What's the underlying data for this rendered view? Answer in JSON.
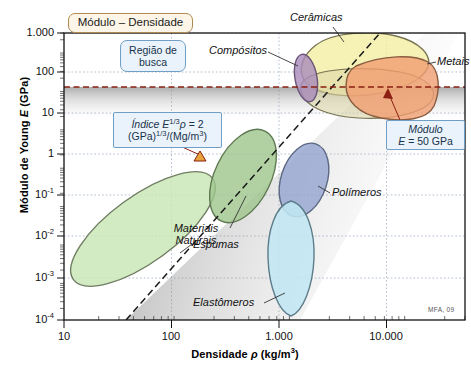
{
  "figure": {
    "kind": "ashby-material-property-chart",
    "signature": "MFA, 09"
  },
  "axes": {
    "y_title_parts": {
      "prefix": "Módulo de Young ",
      "italic": "E",
      "suffix": " (GPa)"
    },
    "x_title_parts": {
      "prefix": "Densidade ",
      "italic": "ρ",
      "suffix": " (kg/m"
    },
    "x_title_exp": "3",
    "x_title_close": ")",
    "y_ticks": [
      {
        "label": "1.000",
        "value": 1000
      },
      {
        "label": "100",
        "value": 100
      },
      {
        "label": "10",
        "value": 10
      },
      {
        "label": "1",
        "value": 1
      },
      {
        "label": "10⁻¹",
        "base": "10",
        "exp": "-1",
        "value": 0.1
      },
      {
        "label": "10⁻²",
        "base": "10",
        "exp": "-2",
        "value": 0.01
      },
      {
        "label": "10⁻³",
        "base": "10",
        "exp": "-3",
        "value": 0.001
      },
      {
        "label": "10⁻⁴",
        "base": "10",
        "exp": "-4",
        "value": 0.0001
      }
    ],
    "x_ticks": [
      {
        "label": "10",
        "value": 10
      },
      {
        "label": "100",
        "value": 100
      },
      {
        "label": "1.000",
        "value": 1000
      },
      {
        "label": "10.000",
        "value": 10000
      }
    ]
  },
  "callouts": [
    {
      "id": "title-box",
      "text": "Módulo – Densidade",
      "style": "cream"
    },
    {
      "id": "search-region",
      "line1": "Região de",
      "line2": "busca",
      "style": "blue"
    },
    {
      "id": "index-box",
      "style": "blue",
      "l1_italic": "Índice ",
      "l1_E": "E",
      "l1_exp": "1/3",
      "l1_rho": "ρ",
      "l1_eq": " = 2",
      "l2_a": "(GPa)",
      "l2_exp": "1/3",
      "l2_b": "/(Mg/m",
      "l2_exp2": "3",
      "l2_c": ")"
    },
    {
      "id": "modulus-box",
      "style": "blue",
      "line1": "Módulo",
      "line2_E": "E",
      "line2_rest": " = 50 GPa"
    }
  ],
  "series_labels": [
    {
      "name": "Cerâmicas",
      "text": "Cerâmicas"
    },
    {
      "name": "Compósitos",
      "text": "Compósitos"
    },
    {
      "name": "Metais",
      "text": "Metais"
    },
    {
      "name": "Polímeros",
      "text": "Polímeros"
    },
    {
      "name": "MateriaisNaturais",
      "text": "Materiais Naturais",
      "l1": "Materiais",
      "l2": "Naturais"
    },
    {
      "name": "Espumas",
      "text": "Espumas"
    },
    {
      "name": "Elastômeros",
      "text": "Elastômeros"
    }
  ],
  "chart_data": {
    "type": "scatter",
    "title": "Módulo – Densidade",
    "xlabel": "Densidade ρ (kg/m3)",
    "ylabel": "Módulo de Young E (GPa)",
    "xscale": "log",
    "yscale": "log",
    "xlim": [
      10,
      30000
    ],
    "ylim": [
      0.0001,
      3000
    ],
    "grid": true,
    "legend": "in-plot annotations",
    "annotations": [
      {
        "text": "Módulo – Densidade",
        "role": "chart-title-box"
      },
      {
        "text": "Região de busca",
        "role": "search-region-label"
      },
      {
        "text": "Índice E^(1/3)ρ = 2 (GPa)^(1/3)/(Mg/m^3)",
        "role": "material-index-label"
      },
      {
        "text": "Módulo E = 50 GPa",
        "role": "constraint-label"
      },
      {
        "text": "MFA, 09",
        "role": "signature"
      }
    ],
    "guide_lines": [
      {
        "name": "modulus-constraint",
        "type": "horizontal",
        "y": 50,
        "label": "E = 50 GPa",
        "style": "dashed",
        "color": "#8a1f12"
      },
      {
        "name": "index-line",
        "type": "slope",
        "slope_exponent": 3,
        "label": "E^(1/3)/ρ = 2 (GPa)^(1/3)/(Mg/m^3)",
        "style": "dashed",
        "color": "#1a1a1a"
      }
    ],
    "shaded_regions": [
      {
        "name": "below-modulus-constraint",
        "description": "grey gradient band below E = 50 GPa"
      },
      {
        "name": "below-index-line",
        "description": "grey gradient wedge below the E^(1/3)/ρ guide line"
      }
    ],
    "bubbles": [
      {
        "name": "Cerâmicas",
        "color": "#f2ea9a",
        "rho_range": [
          1800,
          8000
        ],
        "E_range": [
          20,
          1000
        ]
      },
      {
        "name": "Compósitos",
        "color": "#a58cb6",
        "rho_range": [
          1500,
          2100
        ],
        "E_range": [
          15,
          200
        ]
      },
      {
        "name": "Metais",
        "color": "#ef9a6e",
        "rho_range": [
          2500,
          20000
        ],
        "E_range": [
          8,
          300
        ]
      },
      {
        "name": "Polímeros",
        "color": "#8fa0cc",
        "rho_range": [
          800,
          1600
        ],
        "E_range": [
          0.05,
          8
        ]
      },
      {
        "name": "Materiais Naturais",
        "color": "#9dc08b",
        "rho_range": [
          200,
          1100
        ],
        "E_range": [
          0.05,
          40
        ]
      },
      {
        "name": "Espumas",
        "color": "#c6e3b0",
        "rho_range": [
          14,
          400
        ],
        "E_range": [
          0.0005,
          1
        ]
      },
      {
        "name": "Elastômeros",
        "color": "#bfe6f2",
        "rho_range": [
          900,
          1600
        ],
        "E_range": [
          0.0003,
          0.06
        ]
      }
    ]
  },
  "colors": {
    "accent_red": "#8a1f12",
    "callout_border": "#6f9fc6",
    "title_border": "#b08a52",
    "grid": "#9aabc0"
  }
}
